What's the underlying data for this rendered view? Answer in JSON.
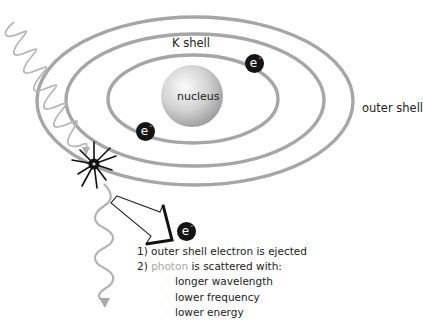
{
  "diagram": {
    "type": "Compton scattering atom diagram",
    "labels": {
      "k_shell": "K shell",
      "outer_shell": "outer shell",
      "nucleus": "nucleus"
    },
    "electron_symbol": "e",
    "electron_charge": "-",
    "electrons": [
      {
        "shell": "K shell",
        "position": "upper-right"
      },
      {
        "shell": "K shell",
        "position": "lower-left"
      },
      {
        "shell": "ejected",
        "position": "below arrow"
      }
    ],
    "notes": {
      "line1": "1) outer shell electron is ejected",
      "line2_prefix": "2) ",
      "line2_photon": "photon",
      "line2_suffix": " is scattered with:",
      "sub1": "longer wavelength",
      "sub2": "lower frequency",
      "sub3": "lower energy"
    },
    "colors": {
      "shell": "#a6a6a6",
      "photon_wave": "#b3b3b3",
      "electron": "#141414",
      "nucleus_light": "#f2f2f2",
      "nucleus_dark": "#9a9a9a",
      "text": "#222222",
      "photon_word": "#a8a8a8"
    }
  }
}
